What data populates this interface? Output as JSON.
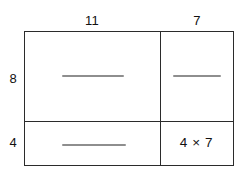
{
  "diagram": {
    "type": "area-model",
    "column_labels": [
      "11",
      "7"
    ],
    "row_labels": [
      "8",
      "4"
    ],
    "cells": [
      [
        {
          "text": "",
          "kind": "blank-line"
        },
        {
          "text": "",
          "kind": "blank-line"
        }
      ],
      [
        {
          "text": "",
          "kind": "blank-line"
        },
        {
          "text": "4 × 7",
          "kind": "expression"
        }
      ]
    ],
    "colors": {
      "stroke": "#2b2b2b",
      "text": "#111111",
      "blank_line": "#8e8e8e",
      "background": "#ffffff"
    }
  }
}
